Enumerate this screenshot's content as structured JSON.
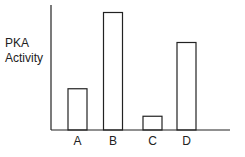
{
  "chart_data": {
    "type": "bar",
    "title": "",
    "xlabel": "",
    "ylabel": "PKA Activity",
    "ylabel_lines": [
      "PKA",
      "Activity"
    ],
    "categories": [
      "A",
      "B",
      "C",
      "D"
    ],
    "values": [
      33,
      94,
      11,
      70
    ],
    "ylim": [
      0,
      100
    ],
    "y_ticks": [],
    "grid": false,
    "legend": null,
    "bar_style": {
      "fill": "#ffffff",
      "stroke": "#222222"
    },
    "axis_color": "#222222"
  }
}
